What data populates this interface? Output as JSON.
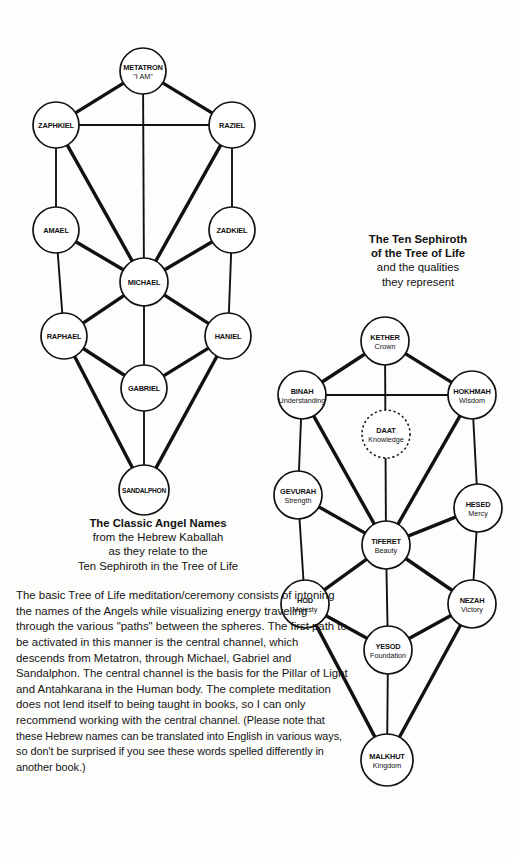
{
  "page": {
    "background": "#fdfdfc",
    "ink": "#111111"
  },
  "angel_diagram": {
    "title": "Tree of Life - Classic Angel Names",
    "nodes": [
      {
        "id": "metatron",
        "name": "METATRON",
        "sub": "\"I AM\"",
        "cx": 143,
        "cy": 71,
        "r": 23
      },
      {
        "id": "zaphkiel",
        "name": "ZAPHKIEL",
        "sub": "",
        "cx": 56,
        "cy": 125,
        "r": 23
      },
      {
        "id": "raziel",
        "name": "RAZIEL",
        "sub": "",
        "cx": 232,
        "cy": 125,
        "r": 23
      },
      {
        "id": "amael",
        "name": "AMAEL",
        "sub": "",
        "cx": 56,
        "cy": 230,
        "r": 23
      },
      {
        "id": "zadkiel",
        "name": "ZADKIEL",
        "sub": "",
        "cx": 232,
        "cy": 230,
        "r": 23
      },
      {
        "id": "michael",
        "name": "MICHAEL",
        "sub": "",
        "cx": 144,
        "cy": 282,
        "r": 24
      },
      {
        "id": "raphael",
        "name": "RAPHAEL",
        "sub": "",
        "cx": 64,
        "cy": 336,
        "r": 23
      },
      {
        "id": "haniel",
        "name": "HANIEL",
        "sub": "",
        "cx": 228,
        "cy": 336,
        "r": 23
      },
      {
        "id": "gabriel",
        "name": "GABRIEL",
        "sub": "",
        "cx": 144,
        "cy": 388,
        "r": 23
      },
      {
        "id": "sandalphon",
        "name": "SANDALPHON",
        "sub": "",
        "cx": 144,
        "cy": 490,
        "r": 25
      }
    ],
    "edges": [
      [
        "metatron",
        "zaphkiel",
        "thick"
      ],
      [
        "metatron",
        "raziel",
        "thick"
      ],
      [
        "metatron",
        "michael",
        "thin"
      ],
      [
        "zaphkiel",
        "raziel",
        "thin"
      ],
      [
        "zaphkiel",
        "amael",
        "thin"
      ],
      [
        "zaphkiel",
        "michael",
        "thick"
      ],
      [
        "raziel",
        "zadkiel",
        "thin"
      ],
      [
        "raziel",
        "michael",
        "thick"
      ],
      [
        "amael",
        "michael",
        "thick"
      ],
      [
        "amael",
        "raphael",
        "thin"
      ],
      [
        "zadkiel",
        "michael",
        "thick"
      ],
      [
        "zadkiel",
        "haniel",
        "thin"
      ],
      [
        "michael",
        "raphael",
        "thick"
      ],
      [
        "michael",
        "haniel",
        "thick"
      ],
      [
        "michael",
        "gabriel",
        "thin"
      ],
      [
        "raphael",
        "gabriel",
        "thick"
      ],
      [
        "raphael",
        "sandalphon",
        "thick"
      ],
      [
        "haniel",
        "gabriel",
        "thick"
      ],
      [
        "haniel",
        "sandalphon",
        "thick"
      ],
      [
        "gabriel",
        "sandalphon",
        "thin"
      ]
    ],
    "caption": {
      "line1": "The Classic Angel Names",
      "line2": "from the Hebrew Kaballah",
      "line3": "as they relate to the",
      "line4": "Ten Sephiroth in the Tree of Life"
    }
  },
  "sephiroth_diagram": {
    "title": "Tree of Life - Ten Sephiroth",
    "nodes": [
      {
        "id": "kether",
        "name": "KETHER",
        "sub": "Crown",
        "cx": 385,
        "cy": 341,
        "r": 24,
        "dashed": false
      },
      {
        "id": "binah",
        "name": "BINAH",
        "sub": "Understanding",
        "cx": 302,
        "cy": 395,
        "r": 24,
        "dashed": false
      },
      {
        "id": "hokhmah",
        "name": "HOKHMAH",
        "sub": "Wisdom",
        "cx": 472,
        "cy": 395,
        "r": 24,
        "dashed": false
      },
      {
        "id": "daat",
        "name": "DAAT",
        "sub": "Knowledge",
        "cx": 386,
        "cy": 434,
        "r": 24,
        "dashed": true
      },
      {
        "id": "gevurah",
        "name": "GEVURAH",
        "sub": "Strength",
        "cx": 298,
        "cy": 495,
        "r": 24,
        "dashed": false
      },
      {
        "id": "hesed",
        "name": "HESED",
        "sub": "Mercy",
        "cx": 478,
        "cy": 508,
        "r": 24,
        "dashed": false
      },
      {
        "id": "tiferet",
        "name": "TIFERET",
        "sub": "Beauty",
        "cx": 386,
        "cy": 545,
        "r": 24,
        "dashed": false
      },
      {
        "id": "hod",
        "name": "HOD",
        "sub": "Majesty",
        "cx": 305,
        "cy": 604,
        "r": 24,
        "dashed": false
      },
      {
        "id": "nezah",
        "name": "NEZAH",
        "sub": "Victory",
        "cx": 472,
        "cy": 604,
        "r": 24,
        "dashed": false
      },
      {
        "id": "yesod",
        "name": "YESOD",
        "sub": "Foundation",
        "cx": 388,
        "cy": 650,
        "r": 24,
        "dashed": false
      },
      {
        "id": "malkhut",
        "name": "MALKHUT",
        "sub": "Kingdom",
        "cx": 387,
        "cy": 760,
        "r": 26,
        "dashed": false
      }
    ],
    "edges": [
      [
        "kether",
        "binah",
        "thick"
      ],
      [
        "kether",
        "hokhmah",
        "thick"
      ],
      [
        "kether",
        "tiferet",
        "thin"
      ],
      [
        "binah",
        "hokhmah",
        "thin"
      ],
      [
        "binah",
        "gevurah",
        "thin"
      ],
      [
        "binah",
        "tiferet",
        "thick"
      ],
      [
        "hokhmah",
        "hesed",
        "thin"
      ],
      [
        "hokhmah",
        "tiferet",
        "thick"
      ],
      [
        "gevurah",
        "tiferet",
        "thick"
      ],
      [
        "gevurah",
        "hod",
        "thin"
      ],
      [
        "hesed",
        "tiferet",
        "thick"
      ],
      [
        "hesed",
        "nezah",
        "thin"
      ],
      [
        "tiferet",
        "hod",
        "thick"
      ],
      [
        "tiferet",
        "nezah",
        "thick"
      ],
      [
        "tiferet",
        "yesod",
        "thin"
      ],
      [
        "hod",
        "yesod",
        "thick"
      ],
      [
        "hod",
        "malkhut",
        "thick"
      ],
      [
        "nezah",
        "yesod",
        "thick"
      ],
      [
        "nezah",
        "malkhut",
        "thick"
      ],
      [
        "yesod",
        "malkhut",
        "thin"
      ]
    ],
    "caption": {
      "line1": "The Ten Sephiroth",
      "line2": "of the Tree of Life",
      "line3": "and the qualities",
      "line4": "they represent"
    }
  },
  "body_text": {
    "part1": "The basic Tree of Life meditation/ceremony consists of intoning the names of the Angels while visualizing energy traveling through the various \"paths\" between the spheres. The first path to be activated in this manner is the central channel, which descends from Metatron, through Michael, Gabriel and Sandalphon. The central channel is the basis for the Pillar of Light and Antahkarana in the Human body. The complete meditation does not lend itself to being taught in books, so I can only recommend working with the ",
    "part2": "central channel. (Please note that these Hebrew names can be translated into English in various ways, so don't be surprised if you see these words spelled differently in another book.)"
  }
}
